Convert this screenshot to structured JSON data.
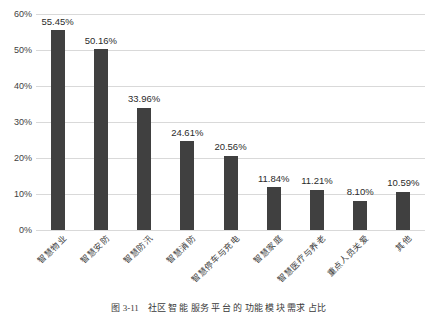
{
  "chart_data": {
    "type": "bar",
    "title": "",
    "xlabel": "",
    "ylabel": "",
    "ylim": [
      0,
      60
    ],
    "ytick_values": [
      0,
      10,
      20,
      30,
      40,
      50,
      60
    ],
    "ytick_labels": [
      "0%",
      "10%",
      "20%",
      "30%",
      "40%",
      "50%",
      "60%"
    ],
    "grid": true,
    "legend": "none",
    "bar_color": "#404040",
    "gridline_color": "#d9d9d9",
    "categories": [
      "智慧物业",
      "智慧安防",
      "智慧防汛",
      "智慧消防",
      "智慧停车与充电",
      "智慧家庭",
      "智慧医疗与养老",
      "重点人员关爱",
      "其他"
    ],
    "values": [
      55.45,
      50.16,
      33.96,
      24.61,
      20.56,
      11.84,
      11.21,
      8.1,
      10.59
    ],
    "data_labels": [
      "55.45%",
      "50.16%",
      "33.96%",
      "24.61%",
      "20.56%",
      "11.84%",
      "11.21%",
      "8.10%",
      "10.59%"
    ]
  },
  "caption": {
    "text": "图 3-11　社区 智 能 服务 平 台 的 功能 模 块 需求 占比"
  }
}
